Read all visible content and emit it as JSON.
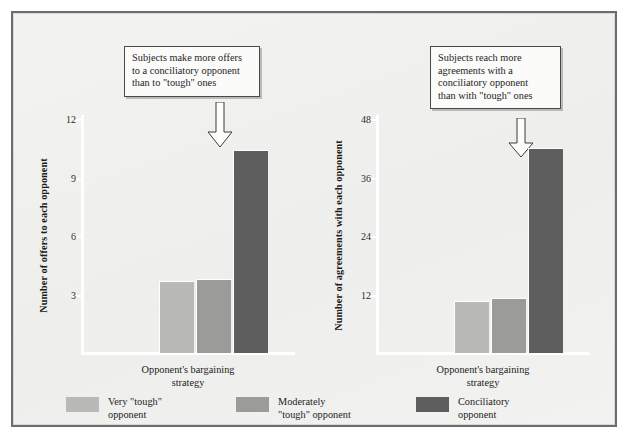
{
  "figure": {
    "background_color": "#f1f1ef",
    "frame_color": "#6c6c6c"
  },
  "palette": {
    "very_tough": "#b9b9b7",
    "moderately_tough": "#9b9b99",
    "conciliatory": "#5e5e5e",
    "axis": "#ffffff",
    "text": "#1d1d1d"
  },
  "legend": {
    "items": [
      {
        "label": "Very \"tough\"\nopponent",
        "color": "#b9b9b7",
        "key": "very-tough"
      },
      {
        "label": "Moderately\n\"tough\" opponent",
        "color": "#9b9b99",
        "key": "moderately-tough"
      },
      {
        "label": "Conciliatory\nopponent",
        "color": "#5e5e5e",
        "key": "conciliatory"
      }
    ]
  },
  "panels": [
    {
      "key": "offers",
      "callout": "Subjects make more offers\nto a conciliatory opponent\nthan to \"tough\" ones",
      "chart_data": {
        "type": "bar",
        "title": "",
        "xlabel": "Opponent's bargaining\nstrategy",
        "ylabel": "Number of offers to each opponent",
        "categories": [
          "Very \"tough\" opponent",
          "Moderately \"tough\" opponent",
          "Conciliatory opponent"
        ],
        "values": [
          3.7,
          3.8,
          10.4
        ],
        "colors": [
          "#b9b9b7",
          "#9b9b99",
          "#5e5e5e"
        ],
        "ylim": [
          0,
          12
        ],
        "yticks": [
          3,
          6,
          9,
          12
        ],
        "ytick_labels": [
          "3",
          "6",
          "9",
          "12"
        ],
        "grid": false,
        "legend_position": "bottom-shared",
        "annotation": {
          "text": "Subjects make more offers\nto a conciliatory opponent\nthan to \"tough\" ones",
          "points_to": "Conciliatory opponent"
        }
      }
    },
    {
      "key": "agreements",
      "callout": "Subjects reach more\nagreements with a\nconciliatory opponent\nthan with \"tough\" ones",
      "chart_data": {
        "type": "bar",
        "title": "",
        "xlabel": "Opponent's bargaining\nstrategy",
        "ylabel": "Number of agreements with each opponent",
        "categories": [
          "Very \"tough\" opponent",
          "Moderately \"tough\" opponent",
          "Conciliatory opponent"
        ],
        "values": [
          10.7,
          11.3,
          42.0
        ],
        "colors": [
          "#b9b9b7",
          "#9b9b99",
          "#5e5e5e"
        ],
        "ylim": [
          0,
          48
        ],
        "yticks": [
          12,
          24,
          36,
          48
        ],
        "ytick_labels": [
          "12",
          "24",
          "36",
          "48"
        ],
        "grid": false,
        "legend_position": "bottom-shared",
        "annotation": {
          "text": "Subjects reach more\nagreements with a\nconciliatory opponent\nthan with \"tough\" ones",
          "points_to": "Conciliatory opponent"
        }
      }
    }
  ]
}
